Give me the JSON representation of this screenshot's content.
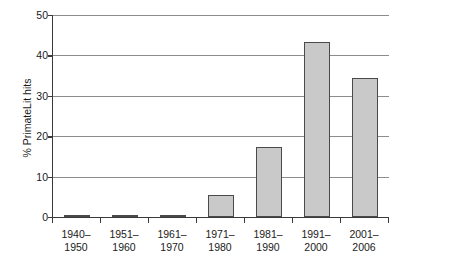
{
  "chart_data": {
    "type": "bar",
    "title": "",
    "xlabel": "",
    "ylabel": "% PrimateLit hits",
    "categories": [
      "1940–1950",
      "1951–1960",
      "1961–1970",
      "1971–1980",
      "1981–1990",
      "1991–2000",
      "2001–2006"
    ],
    "category_lines": [
      [
        "1940–",
        "1950"
      ],
      [
        "1951–",
        "1960"
      ],
      [
        "1961–",
        "1970"
      ],
      [
        "1971–",
        "1980"
      ],
      [
        "1981–",
        "1990"
      ],
      [
        "1991–",
        "2000"
      ],
      [
        "2001–",
        "2006"
      ]
    ],
    "values": [
      0.2,
      0.3,
      0.6,
      5.4,
      17.3,
      43.3,
      34.4
    ],
    "ylim": [
      0,
      50
    ],
    "yticks": [
      0,
      10,
      20,
      30,
      40,
      50
    ],
    "ytick_labels": [
      "0",
      "10",
      "20",
      "30",
      "40",
      "50"
    ],
    "grid": "horizontal",
    "legend": "none",
    "bar_fill_color": "#c9c9c9",
    "bar_border_color": "#4a4a4a",
    "gridline_color": "#8c8c8c",
    "axis_color": "#3a3a3a",
    "background_color": "#ffffff"
  }
}
